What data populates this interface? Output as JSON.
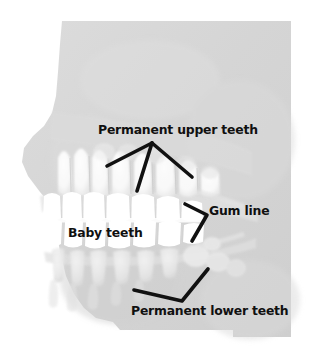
{
  "figure": {
    "type": "anatomical-illustration",
    "background_color": "#ffffff",
    "panel_color": "#d6d6d6",
    "tooth_color": "#ffffff",
    "label_color": "#101010",
    "pointer_color": "#111111"
  },
  "labels": {
    "permanent_upper": "Permanent upper teeth",
    "gum_line": "Gum line",
    "baby_teeth": "Baby teeth",
    "permanent_lower": "Permanent lower teeth"
  },
  "pointers": {
    "upper": "three-pronged arrow pointing up to Permanent upper teeth label",
    "gum": "chevron pointing right toward Gum line label",
    "lower": "v-shaped pointer rising to Permanent lower teeth label"
  }
}
